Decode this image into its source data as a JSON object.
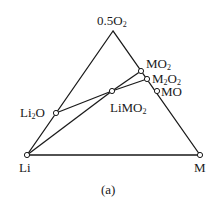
{
  "diagram": {
    "type": "ternary-phase-diagram",
    "caption": "(a)",
    "vertices": {
      "top": {
        "label": "0.5O",
        "sub": "2"
      },
      "left": {
        "label": "Li"
      },
      "right": {
        "label": "M"
      }
    },
    "phases": [
      {
        "id": "MO2",
        "label": "MO",
        "sub": "2"
      },
      {
        "id": "M2O2",
        "label_parts": [
          "M",
          "2",
          "O",
          "2"
        ]
      },
      {
        "id": "MO",
        "label": "MO"
      },
      {
        "id": "LiMO2",
        "label": "LiMO",
        "sub": "2"
      },
      {
        "id": "Li2O",
        "label_parts": [
          "Li",
          "2",
          "O"
        ]
      }
    ],
    "tie_lines": [
      [
        "Li",
        "LiMO2"
      ],
      [
        "Li2O",
        "LiMO2"
      ],
      [
        "LiMO2",
        "MO2"
      ],
      [
        "LiMO2",
        "M2O2"
      ]
    ]
  }
}
